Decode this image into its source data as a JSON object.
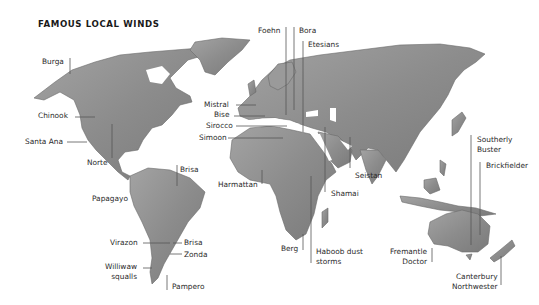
{
  "title": "FAMOUS LOCAL WINDS",
  "colors": {
    "land": "#8f8f8f",
    "land_dark": "#6e6e6e",
    "land_light": "#a8a8a8",
    "leader": "#555555",
    "text": "#2a2a2a",
    "background": "#ffffff"
  },
  "labels": [
    {
      "id": "burga",
      "text": "Burga",
      "x": 42,
      "y": 57,
      "align": "left"
    },
    {
      "id": "chinook",
      "text": "Chinook",
      "x": 38,
      "y": 111,
      "align": "left"
    },
    {
      "id": "santa-ana",
      "text": "Santa Ana",
      "x": 25,
      "y": 137,
      "align": "left"
    },
    {
      "id": "norte",
      "text": "Norte",
      "x": 87,
      "y": 158,
      "align": "left"
    },
    {
      "id": "brisa-north",
      "text": "Brisa",
      "x": 180,
      "y": 165,
      "align": "left"
    },
    {
      "id": "papagayo",
      "text": "Papagayo",
      "x": 92,
      "y": 194,
      "align": "left"
    },
    {
      "id": "virazon",
      "text": "Virazon",
      "x": 110,
      "y": 238,
      "align": "left"
    },
    {
      "id": "brisa-south",
      "text": "Brisa",
      "x": 184,
      "y": 238,
      "align": "left"
    },
    {
      "id": "zonda",
      "text": "Zonda",
      "x": 184,
      "y": 250,
      "align": "left"
    },
    {
      "id": "williwaw",
      "text": "Williwaw\nsqualls",
      "x": 105,
      "y": 262,
      "align": "right"
    },
    {
      "id": "pampero",
      "text": "Pampero",
      "x": 172,
      "y": 282,
      "align": "left"
    },
    {
      "id": "foehn",
      "text": "Foehn",
      "x": 258,
      "y": 26,
      "align": "left"
    },
    {
      "id": "bora",
      "text": "Bora",
      "x": 299,
      "y": 26,
      "align": "left"
    },
    {
      "id": "etesians",
      "text": "Etesians",
      "x": 308,
      "y": 40,
      "align": "left"
    },
    {
      "id": "mistral",
      "text": "Mistral",
      "x": 204,
      "y": 100,
      "align": "left"
    },
    {
      "id": "bise",
      "text": "Bise",
      "x": 214,
      "y": 110,
      "align": "left"
    },
    {
      "id": "sirocco",
      "text": "Sirocco",
      "x": 206,
      "y": 121,
      "align": "left"
    },
    {
      "id": "simoon",
      "text": "Simoon",
      "x": 199,
      "y": 133,
      "align": "left"
    },
    {
      "id": "harmattan",
      "text": "Harmattan",
      "x": 218,
      "y": 180,
      "align": "left"
    },
    {
      "id": "seistan",
      "text": "Seistan",
      "x": 355,
      "y": 171,
      "align": "left"
    },
    {
      "id": "shamai",
      "text": "Shamai",
      "x": 331,
      "y": 189,
      "align": "left"
    },
    {
      "id": "berg",
      "text": "Berg",
      "x": 281,
      "y": 244,
      "align": "left"
    },
    {
      "id": "haboob",
      "text": "Haboob dust\nstorms",
      "x": 316,
      "y": 247,
      "align": "left"
    },
    {
      "id": "southerly-buster",
      "text": "Southerly\nBuster",
      "x": 477,
      "y": 135,
      "align": "left"
    },
    {
      "id": "brickfielder",
      "text": "Brickfielder",
      "x": 486,
      "y": 161,
      "align": "left"
    },
    {
      "id": "fremantle-doctor",
      "text": "Fremantle\nDoctor",
      "x": 390,
      "y": 247,
      "align": "right"
    },
    {
      "id": "canterbury-northwester",
      "text": "Canterbury\nNorthwester",
      "x": 452,
      "y": 272,
      "align": "right"
    }
  ],
  "leaders": [
    {
      "id": "burga",
      "x1": 70,
      "y1": 58,
      "x2": 70,
      "y2": 74
    },
    {
      "id": "chinook",
      "x1": 75,
      "y1": 117,
      "x2": 95,
      "y2": 117
    },
    {
      "id": "santa-ana",
      "x1": 67,
      "y1": 142,
      "x2": 87,
      "y2": 142
    },
    {
      "id": "norte",
      "x1": 112,
      "y1": 158,
      "x2": 112,
      "y2": 124
    },
    {
      "id": "brisa-north",
      "x1": 177,
      "y1": 165,
      "x2": 177,
      "y2": 186
    },
    {
      "id": "virazon",
      "x1": 143,
      "y1": 243,
      "x2": 170,
      "y2": 243
    },
    {
      "id": "brisa-south",
      "x1": 173,
      "y1": 243,
      "x2": 182,
      "y2": 243
    },
    {
      "id": "zonda",
      "x1": 170,
      "y1": 254,
      "x2": 182,
      "y2": 254
    },
    {
      "id": "williwaw",
      "x1": 143,
      "y1": 268,
      "x2": 152,
      "y2": 268
    },
    {
      "id": "pampero",
      "x1": 167,
      "y1": 275,
      "x2": 167,
      "y2": 290
    },
    {
      "id": "foehn",
      "x1": 286,
      "y1": 27,
      "x2": 286,
      "y2": 115
    },
    {
      "id": "bora",
      "x1": 294,
      "y1": 27,
      "x2": 294,
      "y2": 110
    },
    {
      "id": "etesians",
      "x1": 303,
      "y1": 41,
      "x2": 303,
      "y2": 132
    },
    {
      "id": "mistral",
      "x1": 236,
      "y1": 105,
      "x2": 256,
      "y2": 105
    },
    {
      "id": "bise",
      "x1": 234,
      "y1": 116,
      "x2": 265,
      "y2": 116
    },
    {
      "id": "sirocco",
      "x1": 236,
      "y1": 126,
      "x2": 287,
      "y2": 126
    },
    {
      "id": "simoon",
      "x1": 228,
      "y1": 138,
      "x2": 283,
      "y2": 138
    },
    {
      "id": "harmattan",
      "x1": 262,
      "y1": 184,
      "x2": 262,
      "y2": 170
    },
    {
      "id": "seistan",
      "x1": 350,
      "y1": 137,
      "x2": 350,
      "y2": 168
    },
    {
      "id": "shamai",
      "x1": 325,
      "y1": 127,
      "x2": 325,
      "y2": 192
    },
    {
      "id": "berg",
      "x1": 303,
      "y1": 234,
      "x2": 303,
      "y2": 250
    },
    {
      "id": "haboob",
      "x1": 311,
      "y1": 176,
      "x2": 311,
      "y2": 263
    },
    {
      "id": "southerly-buster",
      "x1": 471,
      "y1": 135,
      "x2": 471,
      "y2": 245
    },
    {
      "id": "brickfielder",
      "x1": 480,
      "y1": 162,
      "x2": 480,
      "y2": 235
    },
    {
      "id": "fremantle-doctor",
      "x1": 432,
      "y1": 248,
      "x2": 432,
      "y2": 262
    },
    {
      "id": "canterbury-northwester",
      "x1": 501,
      "y1": 256,
      "x2": 501,
      "y2": 285
    }
  ]
}
